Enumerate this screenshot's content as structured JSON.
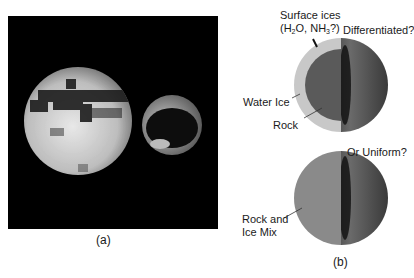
{
  "figure": {
    "panel_a": {
      "caption": "(a)",
      "description": "Image of a large moon and a smaller moon against black background"
    },
    "panel_b": {
      "caption": "(b)",
      "differentiated_model": {
        "title": "Differentiated?",
        "surface_label_line1": "Surface ices",
        "surface_label_line2_prefix": "(H",
        "surface_label_line2_sub1": "2",
        "surface_label_line2_mid": "O, NH",
        "surface_label_line2_sub2": "3",
        "surface_label_line2_suffix": "?)",
        "water_ice_label": "Water Ice",
        "rock_label": "Rock"
      },
      "uniform_model": {
        "title": "Or Uniform?",
        "mix_label_line1": "Rock and",
        "mix_label_line2": "Ice Mix"
      }
    },
    "colors": {
      "background": "#ffffff",
      "panel_bg": "#000000",
      "ice_shell": "#c8c8c8",
      "rock_core": "#5a5a5a",
      "uniform_mix": "#8a8a8a"
    }
  }
}
